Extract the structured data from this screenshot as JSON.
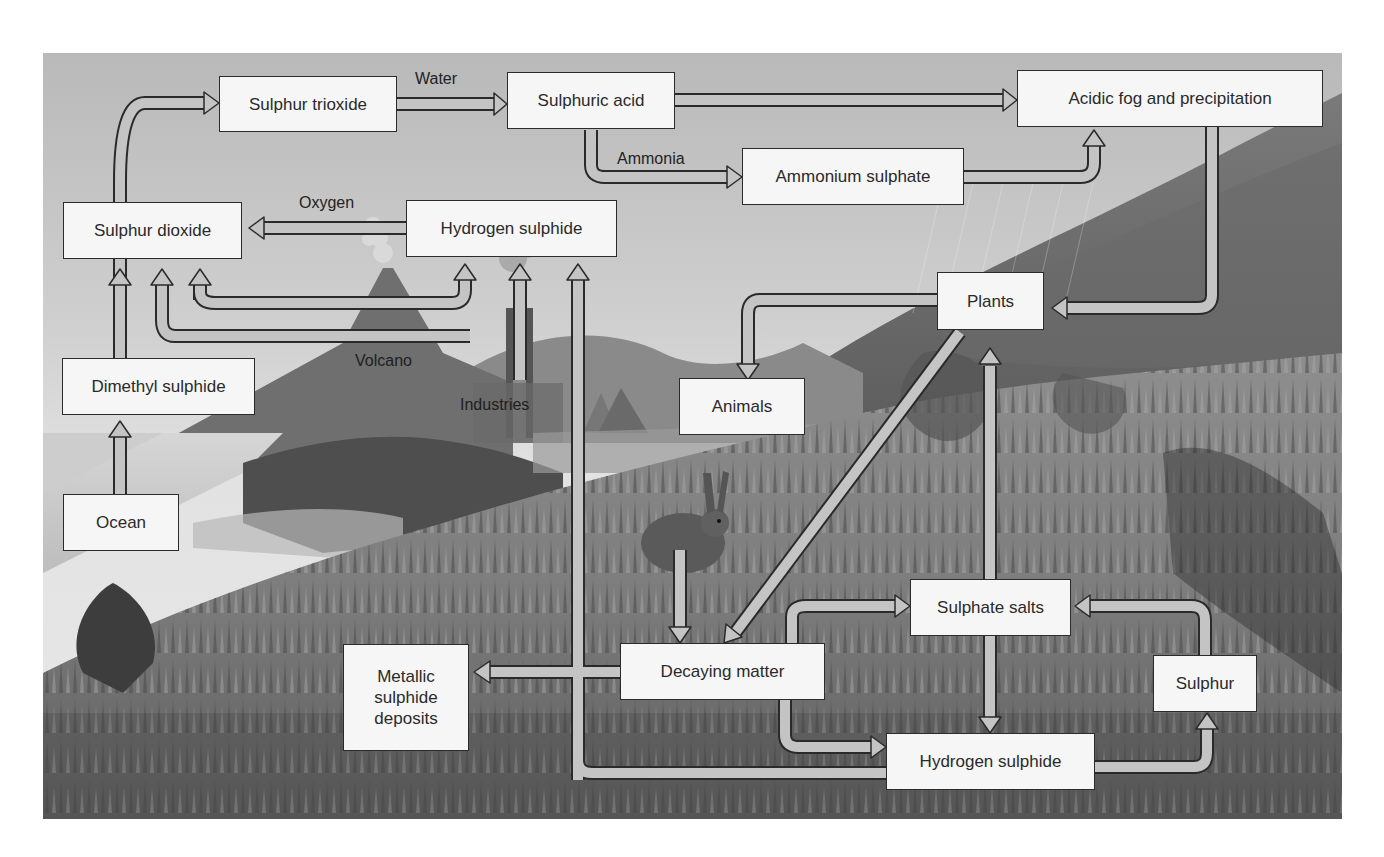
{
  "diagram": {
    "style": {
      "box_fill": "#f6f6f6",
      "box_border": "#2b2b2b",
      "arrow_fill": "#c4c4c4",
      "arrow_outline": "#2a2a2a",
      "background": "grayscale landscape illustration"
    },
    "nodes": {
      "sulphur_trioxide": "Sulphur trioxide",
      "sulphuric_acid": "Sulphuric acid",
      "acidic_fog": "Acidic fog and precipitation",
      "ammonium_sulphate": "Ammonium sulphate",
      "sulphur_dioxide": "Sulphur dioxide",
      "hydrogen_sulphide_top": "Hydrogen sulphide",
      "plants": "Plants",
      "dimethyl_sulphide": "Dimethyl sulphide",
      "animals": "Animals",
      "ocean": "Ocean",
      "sulphate_salts": "Sulphate salts",
      "metallic_sulphide_deposits": "Metallic sulphide deposits",
      "decaying_matter": "Decaying matter",
      "sulphur": "Sulphur",
      "hydrogen_sulphide_bottom": "Hydrogen sulphide"
    },
    "edge_labels": {
      "water": "Water",
      "ammonia": "Ammonia",
      "oxygen": "Oxygen"
    },
    "scene_labels": {
      "volcano": "Volcano",
      "industries": "Industries"
    },
    "edges": [
      {
        "from": "Ocean",
        "to": "Dimethyl sulphide"
      },
      {
        "from": "Dimethyl sulphide",
        "to": "Sulphur dioxide"
      },
      {
        "from": "Sulphur dioxide",
        "to": "Sulphur trioxide"
      },
      {
        "from": "Sulphur trioxide",
        "to": "Sulphuric acid",
        "label": "Water"
      },
      {
        "from": "Sulphuric acid",
        "to": "Acidic fog and precipitation"
      },
      {
        "from": "Sulphuric acid",
        "to": "Ammonium sulphate",
        "label": "Ammonia"
      },
      {
        "from": "Ammonium sulphate",
        "to": "Acidic fog and precipitation"
      },
      {
        "from": "Hydrogen sulphide",
        "to": "Sulphur dioxide",
        "label": "Oxygen"
      },
      {
        "from": "Volcano",
        "to": "Sulphur dioxide"
      },
      {
        "from": "Volcano",
        "to": "Hydrogen sulphide"
      },
      {
        "from": "Industries",
        "to": "Sulphur dioxide"
      },
      {
        "from": "Industries",
        "to": "Hydrogen sulphide"
      },
      {
        "from": "Acidic fog and precipitation",
        "to": "Plants"
      },
      {
        "from": "Plants",
        "to": "Animals"
      },
      {
        "from": "Plants",
        "to": "Decaying matter"
      },
      {
        "from": "Animals",
        "to": "Decaying matter"
      },
      {
        "from": "Sulphate salts",
        "to": "Plants"
      },
      {
        "from": "Sulphate salts",
        "to": "Hydrogen sulphide"
      },
      {
        "from": "Decaying matter",
        "to": "Sulphate salts"
      },
      {
        "from": "Decaying matter",
        "to": "Hydrogen sulphide"
      },
      {
        "from": "Decaying matter",
        "to": "Metallic sulphide deposits"
      },
      {
        "from": "Hydrogen sulphide",
        "to": "Sulphur"
      },
      {
        "from": "Sulphur",
        "to": "Sulphate salts"
      },
      {
        "from": "Hydrogen sulphide (bottom)",
        "to": "Hydrogen sulphide (top)"
      }
    ]
  }
}
